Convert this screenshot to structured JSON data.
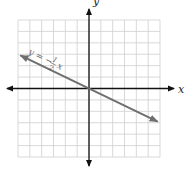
{
  "chart_data": {
    "type": "line",
    "title": "",
    "xlabel": "x",
    "ylabel": "y",
    "xlim": [
      -6,
      6
    ],
    "ylim": [
      -6,
      6
    ],
    "grid": true,
    "grid_step": 1,
    "axes_arrows": true,
    "series": [
      {
        "name": "y = -1/2 x",
        "equation": "y = -½x",
        "slope": -0.5,
        "intercept": 0,
        "x": [
          -5.8,
          5.8
        ],
        "y": [
          2.9,
          -2.9
        ],
        "color": "#6f6f6f",
        "arrows": "both"
      }
    ],
    "annotations": [
      {
        "text_prefix": "y = −",
        "fraction_numerator": "1",
        "fraction_denominator": "2",
        "text_suffix": "x",
        "near_x": -3.5,
        "near_y": 2.2
      }
    ]
  }
}
